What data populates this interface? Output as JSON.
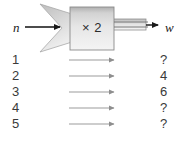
{
  "diagram": {
    "input_variable": "n",
    "output_variable": "w",
    "machine_operation": "× 2",
    "colors": {
      "machine_fill_top": "#b4b4b4",
      "machine_fill_bottom": "#f2f2f2",
      "machine_stroke": "#8a8a8a",
      "funnel_fill": "#cfcfcf",
      "arrow_dark": "#1a1a1a",
      "arrow_light": "#9a9a9a",
      "text": "#3a3a3a",
      "background": "#ffffff"
    },
    "icons": {
      "input_arrow": "arrow-right-icon",
      "output_arrow": "arrow-right-icon",
      "row_arrow": "arrow-right-icon"
    }
  },
  "table": {
    "rows": [
      {
        "input": "1",
        "output": "?"
      },
      {
        "input": "2",
        "output": "4"
      },
      {
        "input": "3",
        "output": "6"
      },
      {
        "input": "4",
        "output": "?"
      },
      {
        "input": "5",
        "output": "?"
      }
    ]
  }
}
